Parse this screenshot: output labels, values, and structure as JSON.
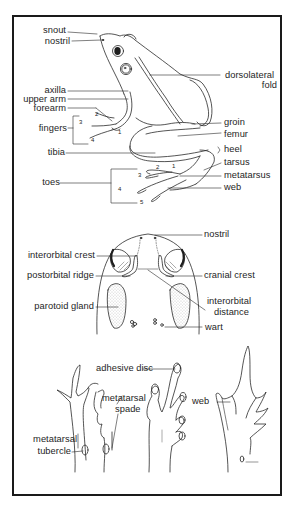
{
  "figure": {
    "side_view": {
      "labels_left": [
        {
          "id": "snout",
          "text": "snout"
        },
        {
          "id": "nostril",
          "text": "nostril"
        },
        {
          "id": "axilla",
          "text": "axilla"
        },
        {
          "id": "upper_arm",
          "text": "upper arm"
        },
        {
          "id": "forearm",
          "text": "forearm"
        },
        {
          "id": "fingers",
          "text": "fingers"
        },
        {
          "id": "tibia",
          "text": "tibia"
        },
        {
          "id": "toes",
          "text": "toes"
        }
      ],
      "labels_right": [
        {
          "id": "dorsolateral_fold_1",
          "text": "dorsolateral"
        },
        {
          "id": "dorsolateral_fold_2",
          "text": "fold"
        },
        {
          "id": "groin",
          "text": "groin"
        },
        {
          "id": "femur",
          "text": "femur"
        },
        {
          "id": "heel",
          "text": "heel"
        },
        {
          "id": "tarsus",
          "text": "tarsus"
        },
        {
          "id": "metatarsus",
          "text": "metatarsus"
        },
        {
          "id": "web",
          "text": "web"
        }
      ],
      "finger_numbers": [
        "2",
        "3",
        "4",
        "1"
      ],
      "toe_numbers": [
        "2",
        "1",
        "3",
        "4",
        "5"
      ]
    },
    "head_view": {
      "labels": [
        {
          "id": "nostril",
          "text": "nostril"
        },
        {
          "id": "interorbital_crest",
          "text": "interorbital crest"
        },
        {
          "id": "postorbital_ridge",
          "text": "postorbital ridge"
        },
        {
          "id": "cranial_crest",
          "text": "cranial crest"
        },
        {
          "id": "parotoid_gland",
          "text": "parotoid gland"
        },
        {
          "id": "interorbital_distance_1",
          "text": "interorbital"
        },
        {
          "id": "interorbital_distance_2",
          "text": "distance"
        },
        {
          "id": "wart",
          "text": "wart"
        }
      ]
    },
    "feet_view": {
      "labels": [
        {
          "id": "adhesive_disc",
          "text": "adhesive disc"
        },
        {
          "id": "metatarsal_spade_1",
          "text": "metatarsal"
        },
        {
          "id": "metatarsal_spade_2",
          "text": "spade"
        },
        {
          "id": "web",
          "text": "web"
        },
        {
          "id": "metatarsal_tubercle_1",
          "text": "metatarsal"
        },
        {
          "id": "metatarsal_tubercle_2",
          "text": "tubercle"
        }
      ]
    },
    "colors": {
      "ink": "#1e1e1e",
      "stipple": "#9a9a9a",
      "paper": "#ffffff"
    }
  }
}
